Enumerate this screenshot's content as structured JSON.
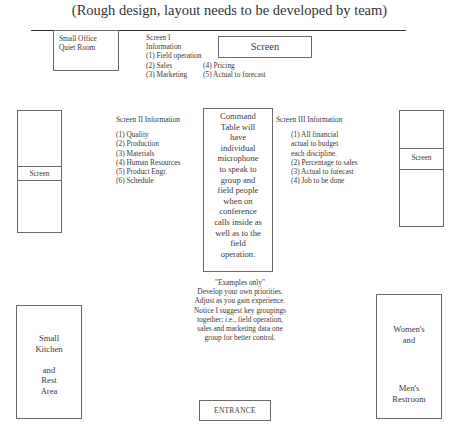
{
  "title": "(Rough design, layout needs to be developed by team)",
  "rooms": {
    "small_office": {
      "lines": [
        "Small Office",
        "Quiet Room"
      ]
    },
    "kitchen": {
      "lines": [
        "Small",
        "Kitchen",
        "",
        "and",
        "Rest",
        "Area"
      ]
    },
    "restroom": {
      "line1": "Women's",
      "line2": "and",
      "line3": "Men's",
      "line4": "Restroom"
    },
    "entrance": {
      "label": "ENTRANCE"
    }
  },
  "screens": {
    "top": {
      "label": "Screen"
    },
    "left": {
      "label": "Screen"
    },
    "right": {
      "label": "Screen"
    }
  },
  "screen1": {
    "heading_line1": "Screen I",
    "heading_line2": "Information",
    "items": [
      "(1) Field operation",
      "(2) Sales",
      "(3) Marketing",
      "(4) Pricing",
      "(5) Actual to forecast"
    ]
  },
  "screen2": {
    "heading": "Screen II Information",
    "items": [
      "(1) Quality",
      "(2) Production",
      "(3) Materials",
      "(4) Human Resources",
      "(5) Product Engr.",
      "(6) Schedule"
    ]
  },
  "screen3": {
    "heading": "Screen III Information",
    "items": [
      "(1) All financial",
      "actual to budget",
      "each discipline.",
      "(2) Percentage to sales",
      "(3) Actual to forecast",
      "(4) Job to be done"
    ]
  },
  "command_table": {
    "lines": [
      "Command",
      "Table will",
      "have",
      "individual",
      "microphone",
      "to speak to",
      "group and",
      "field people",
      "when on",
      "conference",
      "calls inside as",
      "well as to the",
      "field",
      "operation."
    ]
  },
  "note": {
    "lines": [
      "\"Examples only\"",
      "Develop your own priorities.",
      "Adjust as you gain experience.",
      "Notice I suggest key groupings",
      "together; i.e., field operation,",
      "sales and marketing data one",
      "group for better control."
    ]
  }
}
